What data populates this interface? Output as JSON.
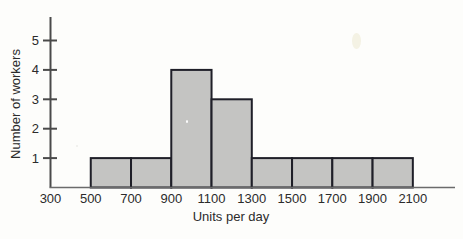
{
  "chart_data": {
    "type": "bar",
    "title": "",
    "subtitle": "",
    "xlabel": "Units per day",
    "ylabel": "Number of workers",
    "grid": false,
    "legend": null,
    "bin_width": 200,
    "bin_edges": [
      500,
      700,
      900,
      1100,
      1300,
      1500,
      1700,
      1900,
      2100
    ],
    "categories": [
      "500-700",
      "700-900",
      "900-1100",
      "1100-1300",
      "1300-1500",
      "1500-1700",
      "1700-1900",
      "1900-2100"
    ],
    "values": [
      1,
      1,
      4,
      3,
      1,
      1,
      1,
      1
    ],
    "xlim": [
      300,
      2100
    ],
    "ylim": [
      0,
      5.6
    ],
    "xticks": [
      300,
      500,
      700,
      900,
      1100,
      1300,
      1500,
      1700,
      1900,
      2100
    ],
    "xtick_labels": [
      "300",
      "500",
      "700",
      "900",
      "1100",
      "1300",
      "1500",
      "1700",
      "1900",
      "2100"
    ],
    "yticks": [
      1,
      2,
      3,
      4,
      5
    ],
    "ytick_labels": [
      "1",
      "2",
      "3",
      "4",
      "5"
    ],
    "bar_fill_color": "#c4c4c2",
    "bar_edge_color": "#1f1f28",
    "axis_color": "#4a4a4a",
    "background_color": "#fdfdfb",
    "text_color": "#2b2b2b"
  }
}
